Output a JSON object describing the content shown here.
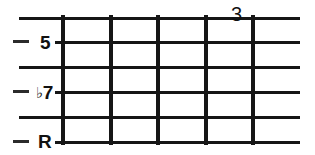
{
  "diagram": {
    "ink_color": "#161616",
    "background_color": "#ffffff",
    "string_count": 6,
    "fret_count": 5,
    "degree_labels": [
      {
        "id": "degree-5",
        "text": "5",
        "string_index": 1,
        "x": 40,
        "y": 33,
        "has_flat": false
      },
      {
        "id": "degree-b7",
        "text": "7",
        "flat": "♭",
        "string_index": 3,
        "x": 36,
        "y": 83,
        "has_flat": true
      },
      {
        "id": "degree-root",
        "text": "R",
        "string_index": 5,
        "x": 38,
        "y": 132,
        "has_flat": false
      }
    ],
    "tick_dashes": [
      {
        "id": "tick-dash-5",
        "x": 13,
        "y": 40
      },
      {
        "id": "tick-dash-b7",
        "x": 13,
        "y": 90
      },
      {
        "id": "tick-dash-root",
        "x": 13,
        "y": 140
      }
    ],
    "fret_markers": [
      {
        "id": "fret-number-3",
        "text": "3",
        "x": 231,
        "y": 4
      }
    ],
    "strings": [
      {
        "id": "string-1",
        "y": 17,
        "x_start": 19,
        "x_end": 300
      },
      {
        "id": "string-2",
        "y": 41,
        "x_start": 55,
        "x_end": 300
      },
      {
        "id": "string-3",
        "y": 66,
        "x_start": 19,
        "x_end": 300
      },
      {
        "id": "string-4",
        "y": 91,
        "x_start": 55,
        "x_end": 300
      },
      {
        "id": "string-5",
        "y": 116,
        "x_start": 19,
        "x_end": 300
      },
      {
        "id": "string-6",
        "y": 141,
        "x_start": 55,
        "x_end": 300
      }
    ],
    "frets": [
      {
        "id": "fret-1",
        "x": 61,
        "y_start": 15,
        "y_end": 145
      },
      {
        "id": "fret-2",
        "x": 109,
        "y_start": 15,
        "y_end": 145
      },
      {
        "id": "fret-3",
        "x": 156,
        "y_start": 15,
        "y_end": 145
      },
      {
        "id": "fret-4",
        "x": 204,
        "y_start": 15,
        "y_end": 145
      },
      {
        "id": "fret-5",
        "x": 251,
        "y_start": 15,
        "y_end": 145
      }
    ]
  }
}
